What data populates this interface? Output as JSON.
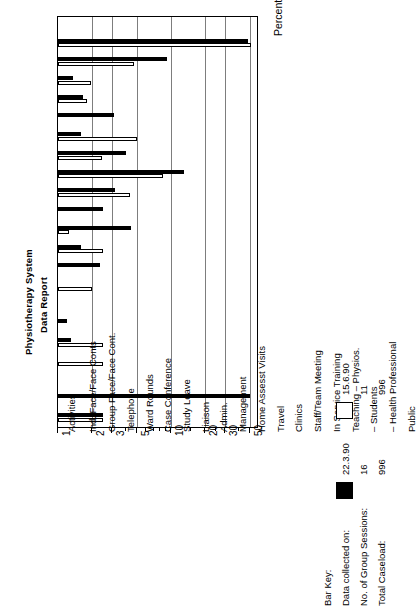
{
  "report": {
    "title_line1": "Physiotherapy System",
    "title_line2": "Data Report"
  },
  "axes": {
    "value_axis_title": "Percentage of Actual Time",
    "category_axis_title": "Activities"
  },
  "key": {
    "heading": "Bar Key:",
    "row_labels": [
      "Data collected on:",
      "No. of Group Sessions:",
      "Total Caseload:"
    ],
    "series": [
      {
        "swatch": "filled",
        "date": "22.3.90",
        "group_sessions": "16",
        "total_caseload": "996"
      },
      {
        "swatch": "empty",
        "date": "15.6.90",
        "group_sessions": "11",
        "total_caseload": "996"
      }
    ]
  },
  "chart_data": {
    "type": "bar",
    "title": "Physiotherapy System Data Report",
    "xlabel": "Activities",
    "ylabel": "Percentage of Actual Time",
    "scale": "log",
    "ylim": [
      1,
      60
    ],
    "grid": true,
    "orientation": "vertical-bars-rotated-page",
    "legend_position": "bottom-right",
    "ticks_major": [
      1,
      2,
      3,
      5,
      10,
      20,
      30,
      50
    ],
    "ticks_labeled": [
      "1",
      "2",
      "3",
      "5",
      "10",
      "20",
      "30",
      "50"
    ],
    "categories": [
      "Ind. Face/Face Conts",
      "Group Face/Face Cont.",
      "Telephone",
      "Ward Rounds",
      "Case Conference",
      "Study Leave",
      "Liaison",
      "Admin.",
      "Management",
      "Home Assesst Visits",
      "Travel",
      "Clinics",
      "Staff/Team Meeting",
      "In Service Training",
      "Teaching  –  Physios.",
      "–  Students",
      "–  Health Professional",
      "Public",
      "Clinical Supervision",
      "–  Other",
      "Completing this Form"
    ],
    "series": [
      {
        "name": "22.3.90",
        "color": "#000000",
        "values": [
          48.0,
          9.2,
          1.35,
          1.65,
          3.1,
          1.6,
          4.0,
          13.0,
          3.2,
          2.5,
          4.4,
          1.6,
          2.35,
          0,
          0,
          1.2,
          1.3,
          0,
          0,
          50.0,
          2.5
        ]
      },
      {
        "name": "15.6.90",
        "color": "#ffffff",
        "values": [
          51.0,
          4.7,
          1.95,
          1.8,
          0,
          5.0,
          2.45,
          8.5,
          4.3,
          0,
          1.25,
          2.5,
          0,
          2.0,
          0,
          0,
          2.5,
          2.5,
          0,
          0,
          2.5
        ]
      }
    ]
  }
}
